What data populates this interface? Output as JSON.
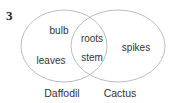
{
  "question_number": "3",
  "diagram": {
    "type": "venn",
    "sets": [
      {
        "name": "Daffodil",
        "only_items": [
          "bulb",
          "leaves"
        ]
      },
      {
        "name": "Cactus",
        "only_items": [
          "spikes"
        ]
      }
    ],
    "intersection": [
      "roots",
      "stem"
    ],
    "line_color": "#b5b5b5",
    "text_color": "#333333"
  },
  "labels": {
    "left_set": "Daffodil",
    "right_set": "Cactus",
    "left_item_1": "bulb",
    "left_item_2": "leaves",
    "shared_item_1": "roots",
    "shared_item_2": "stem",
    "right_item_1": "spikes"
  }
}
